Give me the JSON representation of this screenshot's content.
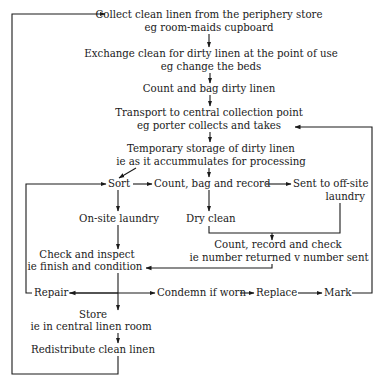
{
  "nodes": {
    "collect": {
      "line1": "Collect clean linen from the periphery store",
      "line2": "eg room-maids cupboard"
    },
    "exchange": {
      "line1": "Exchange clean for dirty linen at the point of use",
      "line2": "eg change the beds"
    },
    "count_bag_dirty": {
      "line1": "Count and bag dirty linen"
    },
    "transport": {
      "line1": "Transport to central collection point",
      "line2": "eg porter collects and takes"
    },
    "temp_storage": {
      "line1": "Temporary storage of dirty linen",
      "line2": "ie as it accummulates for processing"
    },
    "sort": {
      "line1": "Sort"
    },
    "count_bag_record": {
      "line1": "Count, bag and record"
    },
    "sent_offsite": {
      "line1": "Sent to off-site",
      "line2": "laundry"
    },
    "onsite_laundry": {
      "line1": "On-site laundry"
    },
    "dry_clean": {
      "line1": "Dry clean"
    },
    "count_record_check": {
      "line1": "Count, record and check",
      "line2": "ie number returned v number sent"
    },
    "check_inspect": {
      "line1": "Check and inspect",
      "line2": "ie finish and condition"
    },
    "repair": {
      "line1": "Repair"
    },
    "condemn": {
      "line1": "Condemn if worn"
    },
    "replace": {
      "line1": "Replace"
    },
    "mark": {
      "line1": "Mark"
    },
    "store": {
      "line1": "Store",
      "line2": "ie in central linen room"
    },
    "redistribute": {
      "line1": "Redistribute clean linen"
    }
  },
  "colors": {
    "ink": "#1a1a1a",
    "background": "#ffffff"
  }
}
